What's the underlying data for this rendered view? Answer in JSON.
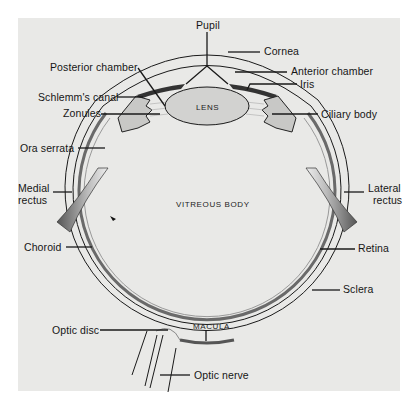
{
  "figure": {
    "background_color": "#ffffff",
    "panel_color": "#e9e9e7",
    "line_color": "#1a1a1a"
  },
  "labels": {
    "pupil": "Pupil",
    "cornea": "Cornea",
    "anterior_chamber": "Anterior chamber",
    "iris": "Iris",
    "ciliary_body": "Ciliary body",
    "posterior_chamber": "Posterior chamber",
    "schlemms_canal": "Schlemm's canal",
    "zonules": "Zonules",
    "ora_serrata": "Ora serrata",
    "medial_rectus_line1": "Medial",
    "medial_rectus_line2": "rectus",
    "lateral_rectus_line1": "Lateral",
    "lateral_rectus_line2": "rectus",
    "choroid": "Choroid",
    "retina": "Retina",
    "sclera": "Sclera",
    "optic_disc": "Optic disc",
    "optic_nerve": "Optic nerve",
    "lens": "LENS",
    "vitreous_body": "VITREOUS BODY",
    "macula": "MACULA"
  }
}
